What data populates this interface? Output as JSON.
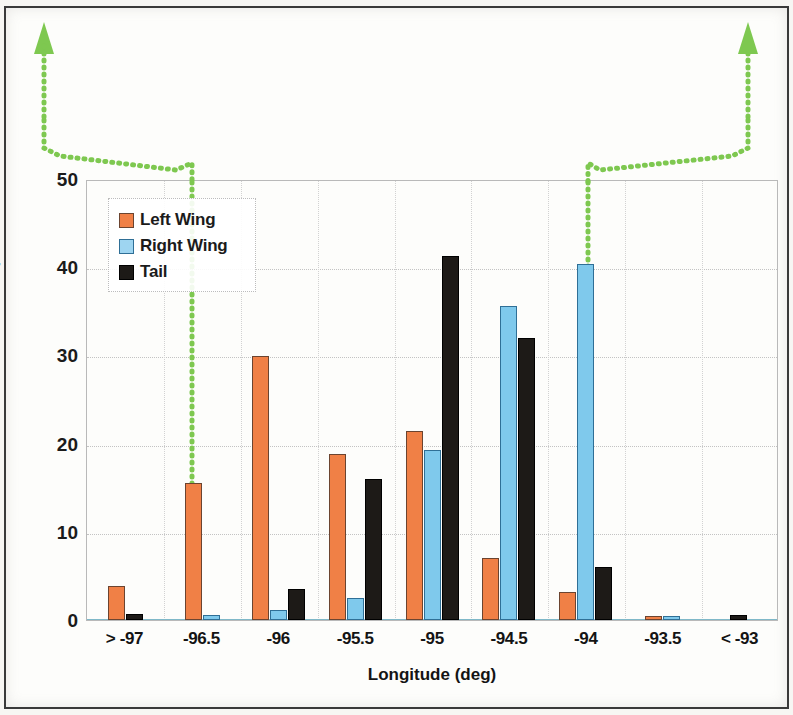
{
  "chart_data": {
    "type": "bar",
    "title": "",
    "xlabel": "Longitude (deg)",
    "ylabel": "Percent of Debris per Bin",
    "categories": [
      "> -97",
      "-96.5",
      "-96",
      "-95.5",
      "-95",
      "-94.5",
      "-94",
      "-93.5",
      "< -93"
    ],
    "series": [
      {
        "name": "Left Wing",
        "color": "#f08046",
        "values": [
          3.8,
          15.5,
          29.9,
          18.8,
          21.4,
          7.0,
          3.2,
          0.4,
          0.0
        ]
      },
      {
        "name": "Right Wing",
        "color": "#7fc9ec",
        "values": [
          0.0,
          0.6,
          1.1,
          2.5,
          19.3,
          35.6,
          40.4,
          0.5,
          0.0
        ]
      },
      {
        "name": "Tail",
        "color": "#1d1a17",
        "values": [
          0.7,
          0.0,
          3.5,
          16.0,
          41.3,
          32.0,
          6.0,
          0.0,
          0.6
        ]
      }
    ],
    "ylim": [
      0,
      50
    ],
    "yticks": [
      0,
      10,
      20,
      30,
      40,
      50
    ],
    "ytick_labels": [
      "0",
      "10",
      "20",
      "30",
      "40",
      "50"
    ],
    "grid": true,
    "legend_position": "top-left",
    "legend_entries": [
      "Left Wing",
      "Right Wing",
      "Tail"
    ]
  },
  "annotations": {
    "accent_color": "#7ec850",
    "callouts": [
      {
        "name": "callout-left",
        "anchor_category": "-96.5",
        "direction": "up"
      },
      {
        "name": "callout-right",
        "anchor_category": "-94",
        "direction": "up"
      }
    ]
  }
}
